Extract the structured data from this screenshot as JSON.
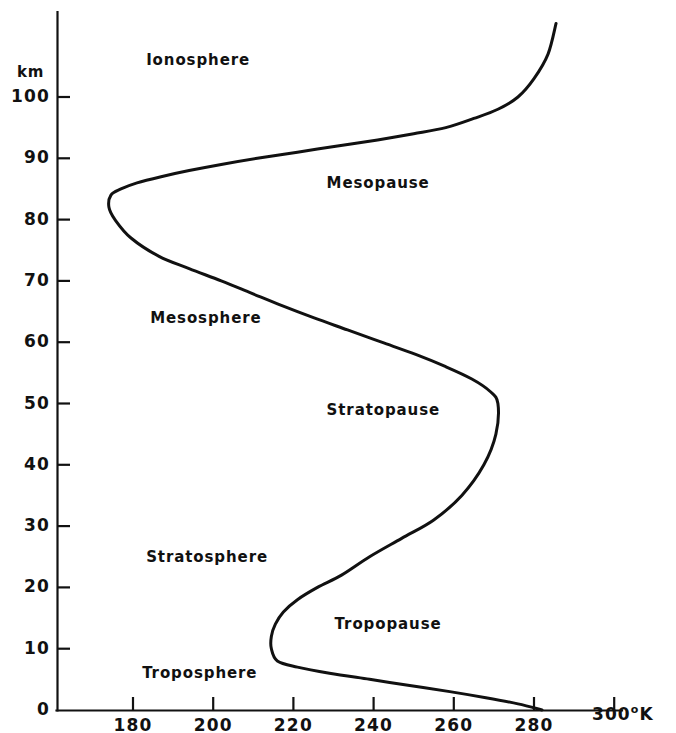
{
  "figure": {
    "background_color": "#ffffff",
    "line_color": "#111111",
    "axis_color": "#111111"
  },
  "axes": {
    "y_unit_label": "km",
    "x_unit_label": "300",
    "x_unit_superscript": "o",
    "x_unit_suffix": "K"
  },
  "chart_data": {
    "type": "line",
    "title": "",
    "subtitle": "",
    "xlabel": "°K",
    "ylabel": "km",
    "xlim": [
      170,
      300
    ],
    "ylim": [
      0,
      112
    ],
    "grid": false,
    "legend": "none",
    "x_ticks": [
      180,
      200,
      220,
      240,
      260,
      280,
      300
    ],
    "x_tick_labels": [
      "180",
      "200",
      "220",
      "240",
      "260",
      "280",
      "300"
    ],
    "y_ticks": [
      0,
      10,
      20,
      30,
      40,
      50,
      60,
      70,
      80,
      90,
      100
    ],
    "y_tick_labels": [
      "0",
      "10",
      "20",
      "30",
      "40",
      "50",
      "60",
      "70",
      "80",
      "90",
      "100"
    ],
    "series": [
      {
        "name": "Standard atmosphere temperature profile",
        "x_values": [
          282,
          276,
          268,
          259,
          249,
          239,
          229,
          221,
          216,
          214.5,
          214.5,
          215.5,
          217.5,
          221,
          226,
          232,
          239,
          247,
          255,
          262,
          267.5,
          270.5,
          271,
          269,
          264.5,
          258,
          250.5,
          242,
          233.5,
          225,
          217,
          209.5,
          202,
          194,
          186.5,
          179.5,
          175.5,
          174,
          174.5,
          177,
          181,
          187,
          194,
          202,
          211,
          221,
          231,
          241,
          250,
          258,
          265,
          271,
          276,
          280,
          283.5,
          285.5
        ],
        "y_values": [
          0,
          1,
          2,
          3,
          4,
          5,
          6,
          7,
          8,
          10,
          12,
          14,
          16,
          18,
          20,
          22,
          25,
          28,
          31,
          35,
          40,
          45,
          50,
          52,
          54,
          56,
          58,
          60,
          62,
          64,
          66,
          68,
          70,
          72,
          74,
          77,
          80,
          82,
          84,
          85,
          86,
          87,
          88,
          89,
          90,
          91,
          92,
          93,
          94,
          95,
          96.5,
          98,
          100,
          103,
          107,
          112
        ],
        "annotations": [
          {
            "label": "Ionosphere",
            "x": 195,
            "y": 106
          },
          {
            "label": "Mesopause",
            "x": 240,
            "y": 86
          },
          {
            "label": "Mesosphere",
            "x": 196,
            "y": 64
          },
          {
            "label": "Stratopause",
            "x": 240,
            "y": 49
          },
          {
            "label": "Stratosphere",
            "x": 195,
            "y": 25
          },
          {
            "label": "Tropopause",
            "x": 242,
            "y": 14
          },
          {
            "label": "Troposphere",
            "x": 194,
            "y": 6
          }
        ]
      }
    ]
  },
  "region_labels": [
    {
      "name": "ionosphere",
      "text": "Ionosphere"
    },
    {
      "name": "mesopause",
      "text": "Mesopause"
    },
    {
      "name": "mesosphere",
      "text": "Mesosphere"
    },
    {
      "name": "stratopause",
      "text": "Stratopause"
    },
    {
      "name": "stratosphere",
      "text": "Stratosphere"
    },
    {
      "name": "tropopause",
      "text": "Tropopause"
    },
    {
      "name": "troposphere",
      "text": "Troposphere"
    }
  ]
}
